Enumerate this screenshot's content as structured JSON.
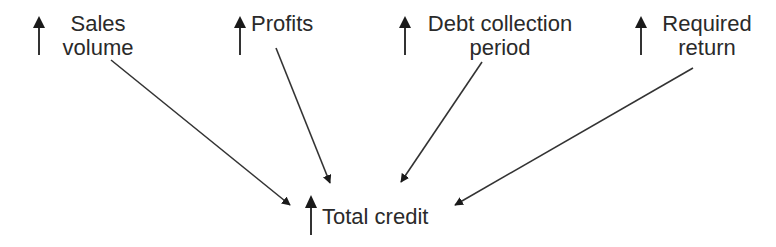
{
  "diagram": {
    "factors": [
      {
        "id": "sales-volume",
        "line1": "Sales",
        "line2": "volume",
        "direction": "up"
      },
      {
        "id": "profits",
        "line1": "Profits",
        "line2": "",
        "direction": "up"
      },
      {
        "id": "debt-collection-period",
        "line1": "Debt collection",
        "line2": "period",
        "direction": "up"
      },
      {
        "id": "required-return",
        "line1": "Required",
        "line2": "return",
        "direction": "up"
      }
    ],
    "target": {
      "id": "total-credit",
      "label": "Total credit",
      "direction": "up"
    }
  }
}
